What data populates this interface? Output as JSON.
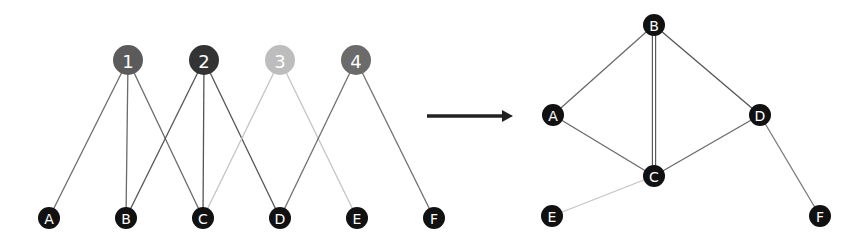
{
  "diagram": {
    "bipartite": {
      "top_nodes": [
        {
          "id": "1",
          "label": "1",
          "x": 128,
          "y": 60,
          "color": "#5b5b5b"
        },
        {
          "id": "2",
          "label": "2",
          "x": 204,
          "y": 60,
          "color": "#333333"
        },
        {
          "id": "3",
          "label": "3",
          "x": 280,
          "y": 60,
          "color": "#bdbdbd"
        },
        {
          "id": "4",
          "label": "4",
          "x": 356,
          "y": 60,
          "color": "#6b6b6b"
        }
      ],
      "bottom_nodes": [
        {
          "id": "A",
          "label": "A",
          "x": 49,
          "y": 218
        },
        {
          "id": "B",
          "label": "B",
          "x": 126,
          "y": 218
        },
        {
          "id": "C",
          "label": "C",
          "x": 203,
          "y": 218
        },
        {
          "id": "D",
          "label": "D",
          "x": 280,
          "y": 218
        },
        {
          "id": "E",
          "label": "E",
          "x": 357,
          "y": 218
        },
        {
          "id": "F",
          "label": "F",
          "x": 434,
          "y": 218
        }
      ],
      "edges": [
        {
          "from": "1",
          "to": "A",
          "color": "#6a6a6a"
        },
        {
          "from": "1",
          "to": "B",
          "color": "#6a6a6a"
        },
        {
          "from": "1",
          "to": "C",
          "color": "#6a6a6a"
        },
        {
          "from": "2",
          "to": "B",
          "color": "#555555"
        },
        {
          "from": "2",
          "to": "C",
          "color": "#555555"
        },
        {
          "from": "2",
          "to": "D",
          "color": "#555555"
        },
        {
          "from": "3",
          "to": "C",
          "color": "#c4c4c4"
        },
        {
          "from": "3",
          "to": "E",
          "color": "#c4c4c4"
        },
        {
          "from": "4",
          "to": "D",
          "color": "#707070"
        },
        {
          "from": "4",
          "to": "F",
          "color": "#707070"
        }
      ]
    },
    "arrow": {
      "x1": 427,
      "y1": 116,
      "x2": 513,
      "y2": 116,
      "color": "#222222"
    },
    "projection": {
      "nodes": [
        {
          "id": "B",
          "label": "B",
          "x": 654,
          "y": 25
        },
        {
          "id": "A",
          "label": "A",
          "x": 553,
          "y": 115
        },
        {
          "id": "D",
          "label": "D",
          "x": 760,
          "y": 115
        },
        {
          "id": "C",
          "label": "C",
          "x": 654,
          "y": 176
        },
        {
          "id": "E",
          "label": "E",
          "x": 552,
          "y": 216
        },
        {
          "id": "F",
          "label": "F",
          "x": 820,
          "y": 216
        }
      ],
      "edges": [
        {
          "from": "A",
          "to": "B",
          "color": "#6a6a6a",
          "weight": 1
        },
        {
          "from": "A",
          "to": "C",
          "color": "#6a6a6a",
          "weight": 1
        },
        {
          "from": "B",
          "to": "C",
          "color": "#5a5a5a",
          "weight": 2
        },
        {
          "from": "B",
          "to": "D",
          "color": "#555555",
          "weight": 1
        },
        {
          "from": "C",
          "to": "D",
          "color": "#6a6a6a",
          "weight": 1
        },
        {
          "from": "C",
          "to": "E",
          "color": "#c4c4c4",
          "weight": 1
        },
        {
          "from": "D",
          "to": "F",
          "color": "#7a7a7a",
          "weight": 1
        }
      ]
    },
    "style": {
      "top_node_radius": 15,
      "bottom_node_radius": 11,
      "proj_node_radius": 11,
      "node_fill": "#111111"
    }
  }
}
